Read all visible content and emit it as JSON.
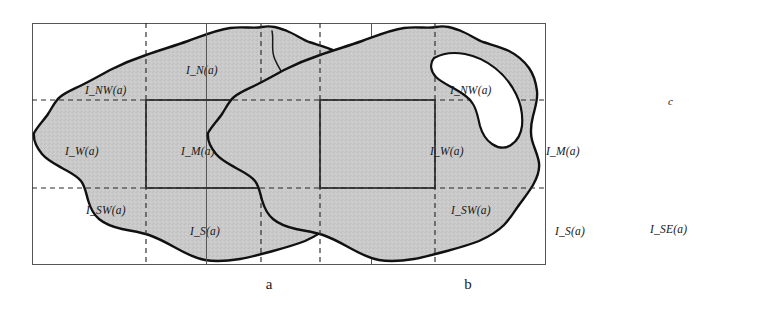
{
  "figure": {
    "colors": {
      "region_fill": "#c9c9c9",
      "outline": "#111111",
      "grid_line": "#2b2b2b",
      "frame": "#555555",
      "hole_fill": "#ffffff",
      "background": "#ffffff",
      "text": "#171717"
    }
  },
  "panels": [
    {
      "caption": "a",
      "frame": {
        "x": 32,
        "y": 23,
        "width": 340,
        "height": 242
      },
      "grid": {
        "vertical_dashed_x": [
          146,
          261
        ],
        "horizontal_dashed_y": [
          100,
          188
        ],
        "center_cell": {
          "x": 146,
          "y": 100,
          "width": 115,
          "height": 88
        }
      },
      "region_labels": [
        {
          "name": "I_NW",
          "text": "I_NW(a)",
          "x": 85,
          "y": 84
        },
        {
          "name": "I_N",
          "text": "I_N(a)",
          "x": 186,
          "y": 64
        },
        {
          "name": "I_W",
          "text": "I_W(a)",
          "x": 65,
          "y": 145
        },
        {
          "name": "I_M",
          "text": "I_M(a)",
          "x": 181,
          "y": 145
        },
        {
          "name": "I_SW",
          "text": "I_SW(a)",
          "x": 86,
          "y": 204
        },
        {
          "name": "I_S",
          "text": "I_S(a)",
          "x": 190,
          "y": 225
        }
      ],
      "feature_labels": [
        {
          "name": "b",
          "text": "b",
          "x": 314,
          "y": 136
        }
      ]
    },
    {
      "caption": "b",
      "frame": {
        "x": 397,
        "y": 23,
        "width": 340,
        "height": 242
      },
      "grid": {
        "vertical_dashed_x": [
          511,
          626
        ],
        "horizontal_dashed_y": [
          100,
          188
        ],
        "center_cell": {
          "x": 511,
          "y": 100,
          "width": 115,
          "height": 88
        }
      },
      "region_labels": [
        {
          "name": "I_NW",
          "text": "I_NW(a)",
          "x": 450,
          "y": 84
        },
        {
          "name": "I_W",
          "text": "I_W(a)",
          "x": 430,
          "y": 145
        },
        {
          "name": "I_M",
          "text": "I_M(a)",
          "x": 546,
          "y": 145
        },
        {
          "name": "I_SW",
          "text": "I_SW(a)",
          "x": 451,
          "y": 204
        },
        {
          "name": "I_S",
          "text": "I_S(a)",
          "x": 555,
          "y": 225
        },
        {
          "name": "I_SE",
          "text": "I_SE(a)",
          "x": 650,
          "y": 223
        }
      ],
      "feature_labels": [
        {
          "name": "c",
          "text": "c",
          "x": 668,
          "y": 95
        }
      ]
    }
  ]
}
